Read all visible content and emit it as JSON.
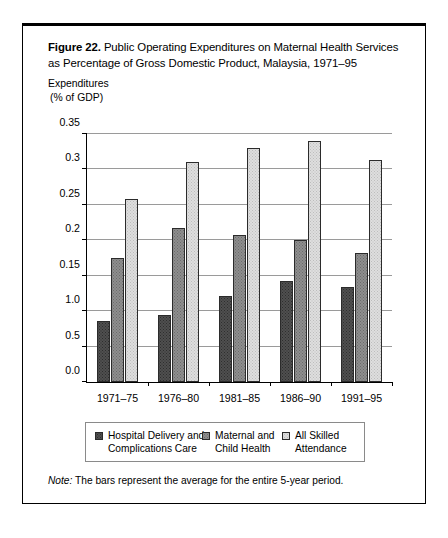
{
  "figure": {
    "number_label": "Figure 22.",
    "title_line1": " Public Operating Expenditures on Maternal Health Services",
    "title_line2": "as Percentage of Gross Domestic Product, Malaysia, 1971–95",
    "axis_caption_line1": "Expenditures",
    "axis_caption_line2": "(% of GDP)",
    "note_label": "Note:",
    "note_text": " The bars represent the average for the entire 5-year period."
  },
  "legend": {
    "items": [
      {
        "label": "Hospital Delivery and\nComplications Care",
        "color": "#4f4f4f"
      },
      {
        "label": "Maternal and\nChild Health",
        "color": "#8e8e8e"
      },
      {
        "label": "All Skilled\nAttendance",
        "color": "#dedede"
      }
    ]
  },
  "chart_data": {
    "type": "bar",
    "xlabel": "",
    "ylabel": "Expenditures (% of GDP)",
    "categories": [
      "1971–75",
      "1976–80",
      "1981–85",
      "1986–90",
      "1991–95"
    ],
    "series": [
      {
        "name": "Hospital Delivery and Complications Care",
        "color": "#4f4f4f",
        "values": [
          0.086,
          0.095,
          0.121,
          0.142,
          0.134
        ]
      },
      {
        "name": "Maternal and Child Health",
        "color": "#8e8e8e",
        "values": [
          0.175,
          0.217,
          0.208,
          0.2,
          0.182
        ]
      },
      {
        "name": "All Skilled Attendance",
        "color": "#dedede",
        "values": [
          0.258,
          0.31,
          0.33,
          0.34,
          0.313
        ]
      }
    ],
    "ylim": [
      0.0,
      0.35
    ],
    "ytick_values": [
      0.0,
      0.05,
      0.1,
      0.15,
      0.2,
      0.25,
      0.3,
      0.35
    ],
    "ytick_labels": [
      "0.0",
      "0.5",
      "1.0",
      "0.15",
      "0.2",
      "0.25",
      "0.3",
      "0.35"
    ],
    "grid": true,
    "legend_position": "bottom"
  }
}
